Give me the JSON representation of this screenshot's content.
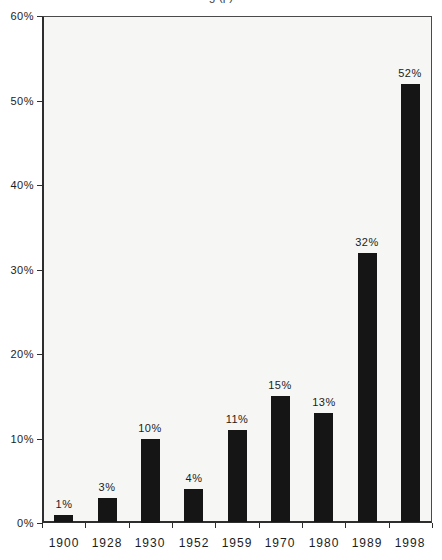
{
  "title_fragment": "g (p)",
  "chart_data": {
    "type": "bar",
    "categories": [
      "1900",
      "1928",
      "1930",
      "1952",
      "1959",
      "1970",
      "1980",
      "1989",
      "1998"
    ],
    "values": [
      1,
      3,
      10,
      4,
      11,
      15,
      13,
      32,
      52
    ],
    "value_labels": [
      "1%",
      "3%",
      "10%",
      "4%",
      "11%",
      "15%",
      "13%",
      "32%",
      "52%"
    ],
    "title": "",
    "xlabel": "",
    "ylabel": "",
    "ylim": [
      0,
      60
    ],
    "ytick_interval": 10,
    "ytick_labels": [
      "0%",
      "10%",
      "20%",
      "30%",
      "40%",
      "50%",
      "60%"
    ],
    "grid": false,
    "legend": "none",
    "colors": {
      "bar": "#151515",
      "plot_background": "#f6f6f5",
      "frame": "#4a4a4a",
      "axis": "#2e2e2e",
      "text": "#1c1c1c"
    }
  }
}
